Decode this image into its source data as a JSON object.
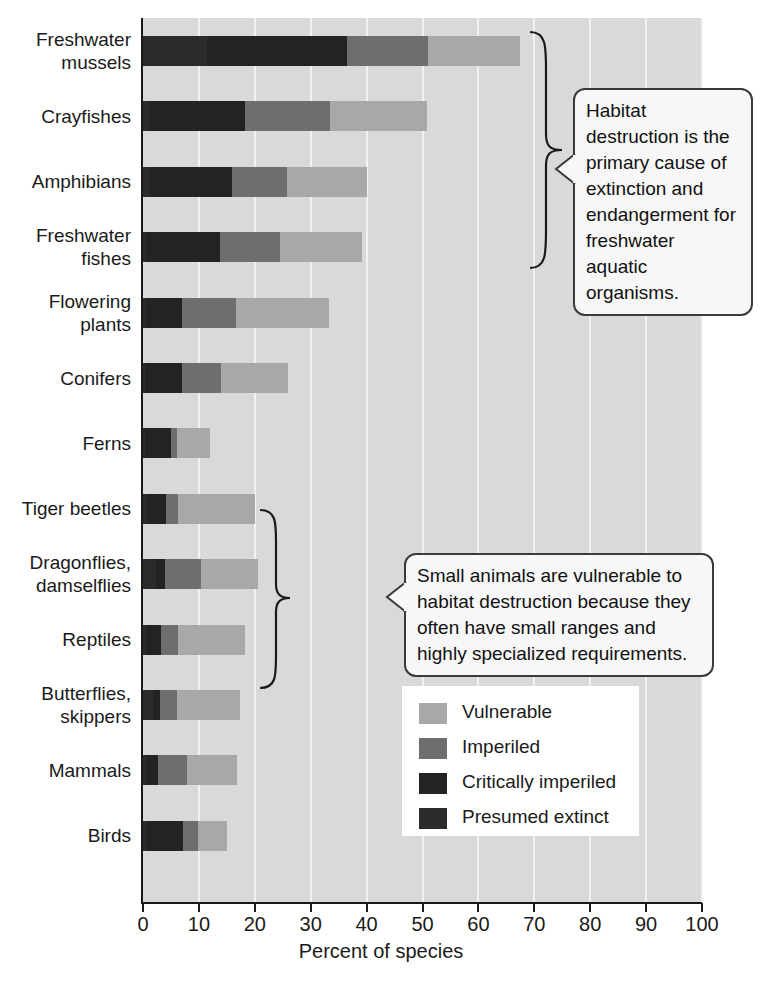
{
  "chart_data": {
    "type": "bar",
    "orientation": "horizontal",
    "stacked": true,
    "title": "",
    "xlabel": "Percent of species",
    "ylabel": "",
    "xlim": [
      0,
      100
    ],
    "xticks": [
      "0",
      "10",
      "20",
      "30",
      "40",
      "50",
      "60",
      "70",
      "80",
      "90",
      "100"
    ],
    "grid": true,
    "legend_position": "inside-bottom-right",
    "categories": [
      "Freshwater mussels",
      "Crayfishes",
      "Amphibians",
      "Freshwater fishes",
      "Flowering plants",
      "Conifers",
      "Ferns",
      "Tiger beetles",
      "Dragonflies, damselflies",
      "Reptiles",
      "Butterflies, skippers",
      "Mammals",
      "Birds"
    ],
    "series": [
      {
        "name": "Presumed extinct",
        "color": "#2b2b2b",
        "values": [
          11.4,
          1.0,
          1.3,
          0.6,
          0.5,
          0.4,
          0.4,
          0.8,
          2.3,
          0.5,
          1.7,
          0.6,
          0.5
        ]
      },
      {
        "name": "Critically imperiled",
        "color": "#232323",
        "values": [
          25.1,
          17.2,
          14.6,
          13.2,
          6.4,
          6.5,
          4.6,
          3.3,
          1.7,
          2.7,
          1.3,
          2.1,
          6.7
        ]
      },
      {
        "name": "Imperiled",
        "color": "#6e6e6e",
        "values": [
          14.5,
          15.3,
          9.8,
          10.7,
          9.7,
          7.1,
          1.1,
          2.2,
          6.4,
          3.1,
          3.1,
          5.1,
          2.7
        ]
      },
      {
        "name": "Vulnerable",
        "color": "#a8a8a8",
        "values": [
          16.4,
          17.3,
          14.3,
          14.6,
          16.6,
          12.0,
          5.8,
          13.7,
          10.1,
          11.9,
          11.3,
          9.0,
          5.2
        ]
      }
    ],
    "totals": [
      67.4,
      50.8,
      40.0,
      39.1,
      33.2,
      26.0,
      11.9,
      20.0,
      20.5,
      18.2,
      17.4,
      16.8,
      15.1
    ]
  },
  "axis": {
    "x_title": "Percent of species",
    "tick_labels": [
      "0",
      "10",
      "20",
      "30",
      "40",
      "50",
      "60",
      "70",
      "80",
      "90",
      "100"
    ]
  },
  "legend": {
    "items": [
      {
        "label": "Vulnerable",
        "swatch_class": "s-vulnerable"
      },
      {
        "label": "Imperiled",
        "swatch_class": "s-imperiled"
      },
      {
        "label": "Critically imperiled",
        "swatch_class": "s-critical"
      },
      {
        "label": "Presumed extinct",
        "swatch_class": "s-extinct"
      }
    ]
  },
  "callouts": [
    {
      "id": "callout-freshwater",
      "text": "Habitat destruction is the primary cause of extinction and endangerment for freshwater aquatic organisms."
    },
    {
      "id": "callout-small-animals",
      "text": "Small animals are vulnerable to habitat destruction because they often have small ranges and highly specialized requirements."
    }
  ],
  "category_labels": [
    {
      "line1": "Freshwater",
      "line2": "mussels"
    },
    {
      "line1": "Crayfishes",
      "line2": ""
    },
    {
      "line1": "Amphibians",
      "line2": ""
    },
    {
      "line1": "Freshwater",
      "line2": "fishes"
    },
    {
      "line1": "Flowering",
      "line2": "plants"
    },
    {
      "line1": "Conifers",
      "line2": ""
    },
    {
      "line1": "Ferns",
      "line2": ""
    },
    {
      "line1": "Tiger beetles",
      "line2": ""
    },
    {
      "line1": "Dragonflies,",
      "line2": "damselflies"
    },
    {
      "line1": "Reptiles",
      "line2": ""
    },
    {
      "line1": "Butterflies,",
      "line2": "skippers"
    },
    {
      "line1": "Mammals",
      "line2": ""
    },
    {
      "line1": "Birds",
      "line2": ""
    }
  ],
  "colors": {
    "plot_background": "#d9d9d9",
    "gridline": "#f2f2f2",
    "axis": "#1a1a1a",
    "legend_background": "#ffffff",
    "callout_background": "#f7f7f7",
    "callout_border": "#3a3a3a"
  }
}
